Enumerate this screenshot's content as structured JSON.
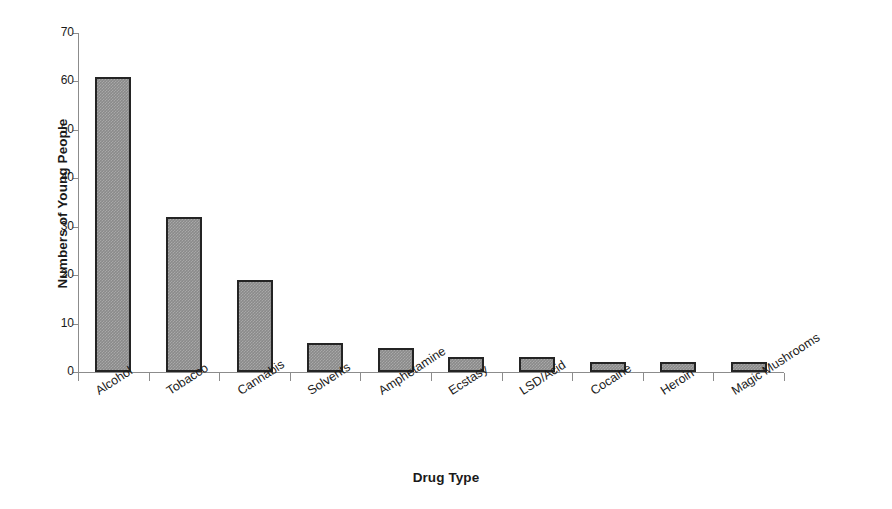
{
  "chart_data": {
    "type": "bar",
    "title": "",
    "xlabel": "Drug Type",
    "ylabel": "Numbers of Young People",
    "categories": [
      "Alcohol",
      "Tobacco",
      "Cannabis",
      "Solvents",
      "Amphetamine",
      "Ecstasy",
      "LSD/Acid",
      "Cocaine",
      "Heroin",
      "Magic Mushrooms"
    ],
    "values": [
      61,
      32,
      19,
      6,
      5,
      3,
      3,
      2,
      2,
      2
    ],
    "ylim": [
      0,
      70
    ],
    "yticks": [
      0,
      10,
      20,
      30,
      40,
      50,
      60,
      70
    ],
    "ytick_labels": [
      "0",
      "10",
      "20",
      "30",
      "40",
      "50",
      "60",
      "70"
    ],
    "grid": false,
    "legend": false,
    "legend_position": "none",
    "bar_color": "#8a8a8a",
    "bar_edge_color": "#242424",
    "axis_color": "#8c8c8c",
    "text_color": "#1a1a1a",
    "background": "#ffffff",
    "label_rotation_degrees": -33
  }
}
